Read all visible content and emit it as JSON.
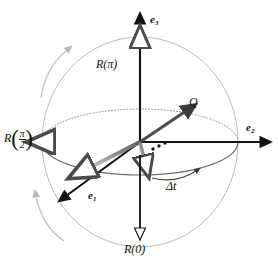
{
  "figure": {
    "background": "#ffffff",
    "sphere": {
      "outline_color": "#b8b8b8",
      "center": [
        140,
        142
      ],
      "rx": 98,
      "ry": 105
    },
    "equator": {
      "front_color": "#6b6b6b",
      "back_color": "#8a8a8a",
      "back_style": "dotted",
      "rx": 98,
      "ry": 33
    },
    "axes": {
      "e3": {
        "label": "e",
        "sub": "3",
        "direction": "up",
        "color": "#111111"
      },
      "e2": {
        "label": "e",
        "sub": "2",
        "direction": "right",
        "color": "#111111"
      },
      "e1": {
        "label": "e",
        "sub": "1",
        "direction": "down-left",
        "color": "#111111"
      }
    },
    "labels": {
      "r_pi": "R(π)",
      "r_zero": "R(0)",
      "r_half": {
        "prefix": "R",
        "numerator": "π",
        "denominator": "2"
      },
      "q": "Q",
      "delta_t": "Δt"
    },
    "markers": {
      "top_pole_arrow": "hollow-up-arrow",
      "bottom_pole_arrow": "hollow-down-arrow",
      "equator_left_arrow": "hollow-left-arrow",
      "dots_count": 3
    },
    "colors": {
      "ink": "#111111",
      "gray_light": "#c3c3c3",
      "gray_mid": "#8a8a8a",
      "gray_dark": "#555555",
      "shaft_gray": "#9a9a9a"
    }
  }
}
